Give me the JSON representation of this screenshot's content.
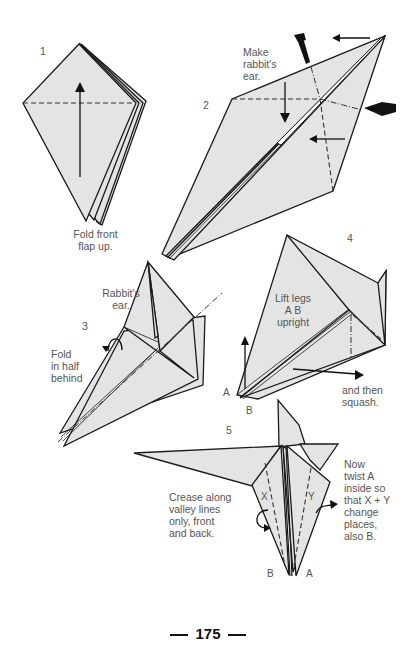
{
  "page": {
    "number": "175",
    "paper_color": "#e4e4e4",
    "line_color": "#1a1a1a"
  },
  "steps": [
    {
      "number": "1",
      "caption": "Fold front\nflap up."
    },
    {
      "number": "2",
      "caption": "Make\nrabbit's\near."
    },
    {
      "number": "3",
      "captions": [
        "Rabbit's\near.",
        "Fold\nin half\nbehind"
      ]
    },
    {
      "number": "4",
      "captions": [
        "Lift legs\nA B\nupright",
        "and then\nsquash."
      ],
      "points": [
        "A",
        "B"
      ]
    },
    {
      "number": "5",
      "captions": [
        "Crease along\nvalley lines\nonly, front\nand back.",
        "Now\ntwist A\ninside so\nthat X + Y\nchange\nplaces,\nalso B."
      ],
      "points": [
        "X",
        "Y",
        "B",
        "A"
      ]
    }
  ],
  "icons": [
    "up-arrow-icon",
    "down-arrow-icon",
    "left-arrow-icon",
    "push-arrow-icon",
    "turn-over-arrow-icon",
    "right-arrow-icon"
  ]
}
